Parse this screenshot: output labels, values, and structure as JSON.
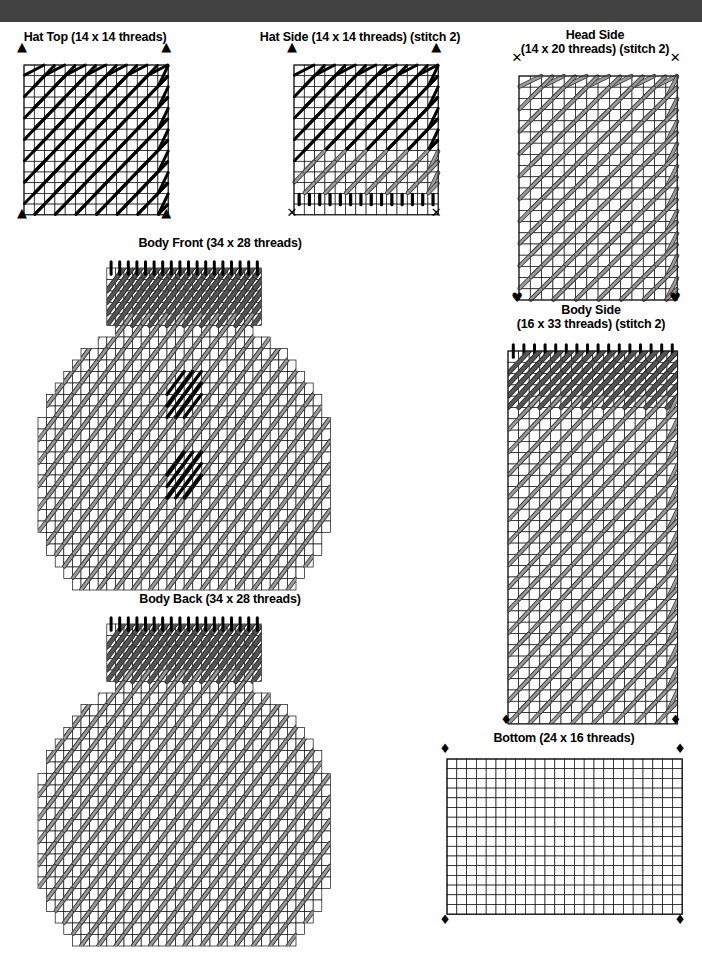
{
  "page": {
    "type": "plastic-canvas-stitch-pattern-chart",
    "background": "#ffffff",
    "header_bar_color": "#424242",
    "width": 702,
    "height": 953
  },
  "palette": {
    "black_stitch": "#000000",
    "gray_stitch_fill": "#9a9a9a",
    "gray_stitch_outline": "#3b3b3b",
    "dark_band_fill": "#555555",
    "grid_line": "#000000",
    "canvas_bg": "#ffffff"
  },
  "legend_symbols": {
    "triangle": "▲",
    "cross": "✕",
    "heart": "♥",
    "diamond": "♦"
  },
  "panels": [
    {
      "id": "hat-top",
      "title": "Hat Top (14 x 14 threads)",
      "title_lines": [
        "Hat Top (14 x 14 threads)"
      ],
      "cols": 14,
      "rows": 14,
      "stitch_note": "",
      "corner_marks": {
        "top_left": "▲",
        "top_right": "▲",
        "bottom_left": "▲",
        "bottom_right": "▲"
      },
      "fill": "black",
      "bands": []
    },
    {
      "id": "hat-side",
      "title": "Hat Side (14 x 14 threads) (stitch 2)",
      "title_lines": [
        "Hat Side (14 x 14 threads) (stitch 2)"
      ],
      "cols": 14,
      "rows": 14,
      "stitch_note": "stitch 2",
      "corner_marks": {
        "top_left": "▲",
        "top_right": "▲",
        "bottom_left": "✕",
        "bottom_right": "✕"
      },
      "fill": "black",
      "bands": [
        {
          "from_row": 9,
          "to_row": 11,
          "color": "gray"
        },
        {
          "from_row": 12,
          "to_row": 13,
          "color": "black-short"
        }
      ]
    },
    {
      "id": "head-side",
      "title": "Head Side (14 x 20 threads) (stitch 2)",
      "title_lines": [
        "Head Side",
        "(14 x 20 threads) (stitch 2)"
      ],
      "cols": 14,
      "rows": 20,
      "stitch_note": "stitch 2",
      "corner_marks": {
        "top_left": "✕",
        "top_right": "✕",
        "bottom_left": "♥",
        "bottom_right": "♥"
      },
      "fill": "gray",
      "bands": []
    },
    {
      "id": "body-front",
      "title": "Body Front (34 x 28 threads)",
      "title_lines": [
        "Body Front (34 x 28 threads)"
      ],
      "cols": 34,
      "rows": 28,
      "stitch_note": "",
      "corner_marks": {},
      "fill": "gray",
      "shape": "octagon-with-neck",
      "eyes": 2,
      "bands": [
        {
          "from_row": 0,
          "to_row": 4,
          "color": "dark"
        }
      ]
    },
    {
      "id": "body-back",
      "title": "Body Back (34 x 28 threads)",
      "title_lines": [
        "Body Back (34 x 28 threads)"
      ],
      "cols": 34,
      "rows": 28,
      "stitch_note": "",
      "corner_marks": {},
      "fill": "gray",
      "shape": "octagon-with-neck",
      "eyes": 0,
      "bands": [
        {
          "from_row": 0,
          "to_row": 4,
          "color": "dark"
        }
      ]
    },
    {
      "id": "body-side",
      "title": "Body Side (16 x 33 threads) (stitch 2)",
      "title_lines": [
        "Body Side",
        "(16 x 33 threads) (stitch 2)"
      ],
      "cols": 16,
      "rows": 33,
      "stitch_note": "stitch 2",
      "corner_marks": {
        "bottom_left": "♦",
        "bottom_right": "♦"
      },
      "fill": "gray",
      "bands": [
        {
          "from_row": 0,
          "to_row": 4,
          "color": "dark"
        }
      ]
    },
    {
      "id": "bottom",
      "title": "Bottom (24 x 16 threads)",
      "title_lines": [
        "Bottom (24 x 16 threads)"
      ],
      "cols": 24,
      "rows": 16,
      "stitch_note": "",
      "corner_marks": {
        "top_left": "♦",
        "top_right": "♦",
        "bottom_left": "♦",
        "bottom_right": "♦"
      },
      "fill": "none",
      "bands": []
    }
  ]
}
